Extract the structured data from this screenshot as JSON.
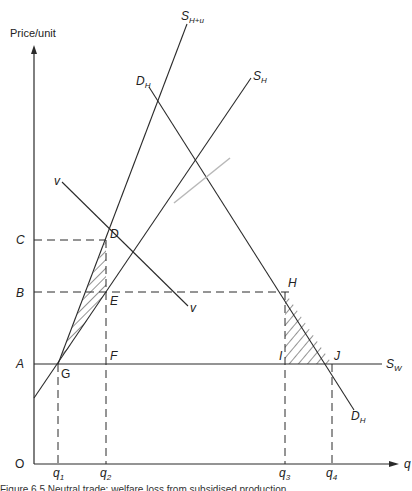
{
  "figure": {
    "y_axis_label": "Price/unit",
    "x_axis_label": "q",
    "origin_label": "O",
    "price_labels": {
      "C": "C",
      "B": "B",
      "A": "A"
    },
    "quantity_labels": {
      "q1": "q",
      "q1_sub": "1",
      "q2": "q",
      "q2_sub": "2",
      "q3": "q",
      "q3_sub": "3",
      "q4": "q",
      "q4_sub": "4"
    },
    "points": {
      "D": "D",
      "E": "E",
      "F": "F",
      "G": "G",
      "H": "H",
      "I": "I",
      "J": "J"
    },
    "curves": {
      "s_hu": {
        "main": "S",
        "sub": "H+u"
      },
      "s_h": {
        "main": "S",
        "sub": "H"
      },
      "d_h_top": {
        "main": "D",
        "sub": "H"
      },
      "d_h_bottom": {
        "main": "D",
        "sub": "H"
      },
      "s_w": {
        "main": "S",
        "sub": "W"
      },
      "v_top": "v",
      "v_bottom": "v"
    },
    "caption": "Figure 6.5  Neutral trade: welfare loss from subsidised production"
  },
  "colors": {
    "line": "#2a2a2a",
    "hatch": "#2a2a2a",
    "stray": "#b8b8b8"
  }
}
